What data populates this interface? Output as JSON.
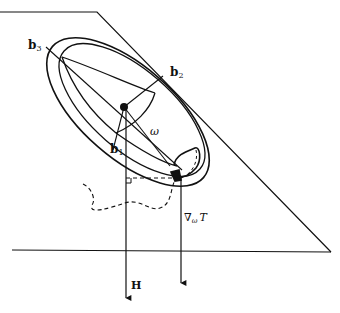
{
  "figure": {
    "labels": {
      "b1": "b",
      "b1_sub": "1",
      "b2": "b",
      "b2_sub": "2",
      "b3": "b",
      "b3_sub": "3",
      "omega": "ω",
      "H": "H",
      "grad_nabla": "∇",
      "grad_sub": "ω",
      "grad_T": "T"
    },
    "colors": {
      "line": "#111111",
      "background": "#ffffff"
    }
  }
}
